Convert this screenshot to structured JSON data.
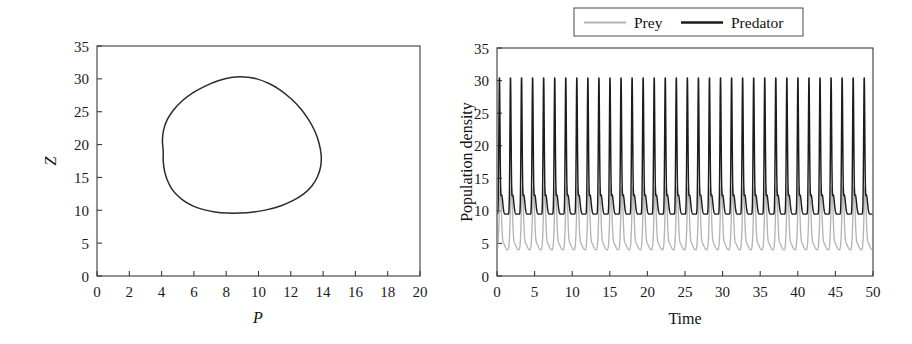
{
  "figure": {
    "background": "#ffffff",
    "panels": [
      "phase-portrait",
      "time-series"
    ]
  },
  "colors": {
    "prey": "#b4b4b4",
    "predator": "#1c1c1c",
    "axis": "#3a3a3a",
    "text": "#1a1a1a"
  },
  "left_panel": {
    "xlabel": "P",
    "ylabel": "Z",
    "xticks": [
      "0",
      "2",
      "4",
      "6",
      "8",
      "10",
      "12",
      "14",
      "16",
      "18",
      "20"
    ],
    "yticks": [
      "0",
      "5",
      "10",
      "15",
      "20",
      "25",
      "30",
      "35"
    ]
  },
  "right_panel": {
    "xlabel": "Time",
    "ylabel": "Population density",
    "xticks": [
      "0",
      "5",
      "10",
      "15",
      "20",
      "25",
      "30",
      "35",
      "40",
      "45",
      "50"
    ],
    "yticks": [
      "0",
      "5",
      "10",
      "15",
      "20",
      "25",
      "30",
      "35"
    ],
    "legend": {
      "items": [
        {
          "label": "Prey",
          "color": "#b4b4b4",
          "width": 1.8
        },
        {
          "label": "Predator",
          "color": "#1c1c1c",
          "width": 2.6
        }
      ]
    }
  },
  "chart_data": [
    {
      "type": "line",
      "name": "phase-portrait",
      "title": "",
      "xlabel": "P",
      "ylabel": "Z",
      "xlim": [
        0,
        20
      ],
      "ylim": [
        0,
        35
      ],
      "xticks": [
        0,
        2,
        4,
        6,
        8,
        10,
        12,
        14,
        16,
        18,
        20
      ],
      "yticks": [
        0,
        5,
        10,
        15,
        20,
        25,
        30,
        35
      ],
      "grid": false,
      "legend": "none",
      "description": "Closed limit cycle (egg-shaped orbit) of predator Z versus prey P",
      "series": [
        {
          "name": "limit cycle",
          "color": "#2b2b2b",
          "closed": true,
          "points": [
            [
              4.1,
              19.0
            ],
            [
              4.05,
              20.6
            ],
            [
              4.12,
              22.2
            ],
            [
              4.35,
              23.8
            ],
            [
              4.75,
              25.3
            ],
            [
              5.3,
              26.7
            ],
            [
              5.95,
              27.9
            ],
            [
              6.7,
              28.9
            ],
            [
              7.5,
              29.7
            ],
            [
              8.3,
              30.2
            ],
            [
              9.1,
              30.3
            ],
            [
              9.9,
              30.0
            ],
            [
              10.65,
              29.3
            ],
            [
              11.35,
              28.3
            ],
            [
              12.0,
              27.0
            ],
            [
              12.6,
              25.5
            ],
            [
              13.1,
              23.8
            ],
            [
              13.5,
              22.0
            ],
            [
              13.75,
              20.2
            ],
            [
              13.88,
              18.4
            ],
            [
              13.85,
              16.7
            ],
            [
              13.65,
              15.1
            ],
            [
              13.3,
              13.7
            ],
            [
              12.8,
              12.5
            ],
            [
              12.15,
              11.5
            ],
            [
              11.4,
              10.7
            ],
            [
              10.55,
              10.1
            ],
            [
              9.7,
              9.75
            ],
            [
              8.85,
              9.58
            ],
            [
              8.05,
              9.58
            ],
            [
              7.3,
              9.75
            ],
            [
              6.6,
              10.1
            ],
            [
              6.0,
              10.6
            ],
            [
              5.45,
              11.3
            ],
            [
              5.0,
              12.2
            ],
            [
              4.62,
              13.3
            ],
            [
              4.35,
              14.6
            ],
            [
              4.18,
              16.0
            ],
            [
              4.1,
              17.5
            ]
          ]
        }
      ]
    },
    {
      "type": "line",
      "name": "time-series",
      "title": "",
      "xlabel": "Time",
      "ylabel": "Population density",
      "xlim": [
        0,
        50
      ],
      "ylim": [
        0,
        35
      ],
      "xticks": [
        0,
        5,
        10,
        15,
        20,
        25,
        30,
        35,
        40,
        45,
        50
      ],
      "yticks": [
        0,
        5,
        10,
        15,
        20,
        25,
        30,
        35
      ],
      "grid": false,
      "legend": "top-center",
      "description": "Sustained predator-prey oscillations; about 34 cycles over 50 time units (period about 1.47)",
      "oscillation": {
        "period": 1.47,
        "n_cycles": 34,
        "prey": {
          "min": 4.0,
          "max": 13.6,
          "mean": 8.8,
          "peak_shape": "narrow-crest",
          "phase_offset": 0.0
        },
        "predator": {
          "min": 9.5,
          "max": 30.4,
          "mean": 14.5,
          "peak_shape": "sharp-spike",
          "phase_offset": 0.28
        }
      },
      "series": [
        {
          "name": "Prey",
          "color": "#b4b4b4",
          "min": 4.0,
          "max": 13.6
        },
        {
          "name": "Predator",
          "color": "#1c1c1c",
          "min": 9.5,
          "max": 30.4
        }
      ]
    }
  ]
}
